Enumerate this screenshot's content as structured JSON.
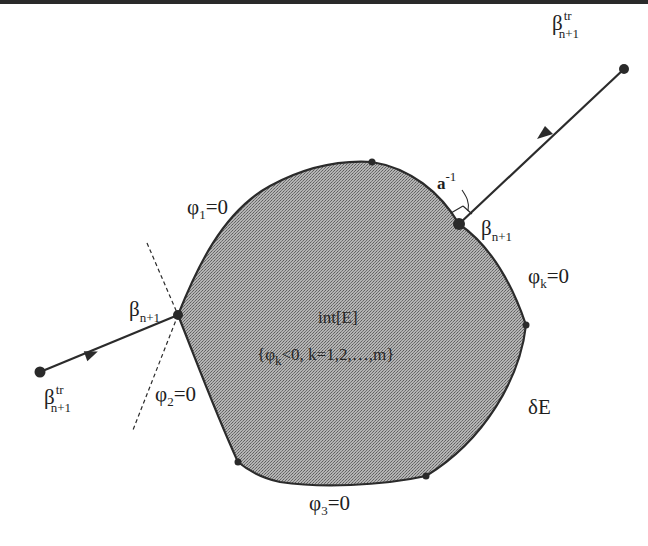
{
  "diagram": {
    "region": {
      "interior_label": "int[E]",
      "interior_condition": "{φk<0,  k=1,2,…,m}",
      "condition_parts": {
        "open": "{φ",
        "sub": "k",
        "rest": "<0,  k=1,2,…,m}"
      },
      "boundary_label": "δE"
    },
    "constraints": [
      {
        "id": "phi1",
        "symbol": "φ",
        "sub": "1",
        "rest": "=0"
      },
      {
        "id": "phi2",
        "symbol": "φ",
        "sub": "2",
        "rest": "=0"
      },
      {
        "id": "phi3",
        "symbol": "φ",
        "sub": "3",
        "rest": "=0"
      },
      {
        "id": "phik",
        "symbol": "φ",
        "sub": "k",
        "rest": "=0"
      }
    ],
    "points": {
      "trial_right": {
        "base": "β",
        "sub": "n+1",
        "sup": "tr"
      },
      "return_right": {
        "base": "β",
        "sub": "n+1"
      },
      "trial_left": {
        "base": "β",
        "sub": "n+1",
        "sup": "tr"
      },
      "return_left": {
        "base": "β",
        "sub": "n+1"
      }
    },
    "annotation": {
      "base": "a",
      "sup": "-1"
    },
    "colors": {
      "fill": "#9a9a9a",
      "stroke": "#2b2b2b",
      "point": "#2a2a2a"
    }
  }
}
